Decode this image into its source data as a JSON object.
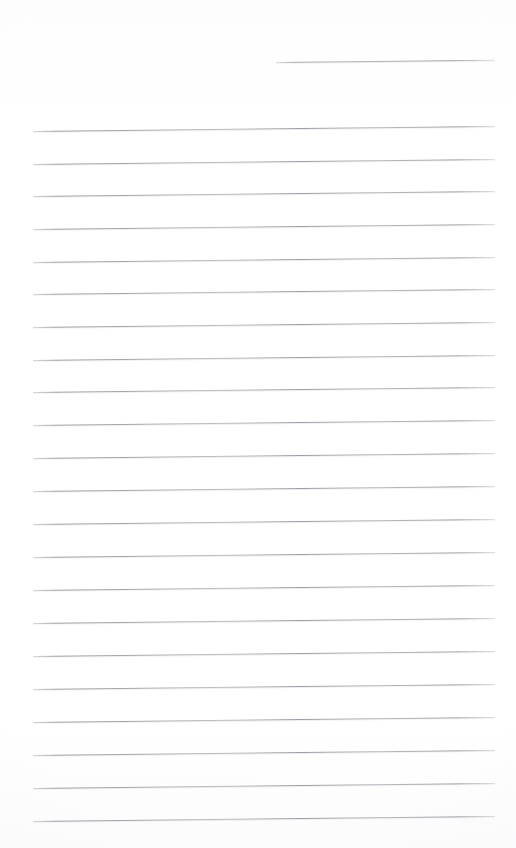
{
  "document": {
    "kind": "scanned-lined-paper",
    "title": "Blank Lined Notebook Page",
    "page_background_color": "#ffffff",
    "rule_color": "#9a9aa2",
    "page_width": 516,
    "page_height": 848,
    "content_text": "",
    "is_blank": "true",
    "rule_count": "23",
    "rule_thickness": "1",
    "margin_left": 33,
    "margin_right": 495,
    "line_spacing": 32.6,
    "skew_degrees": -0.62,
    "rules": [
      {
        "id": "rule-date-line",
        "label": "date-line",
        "x": 276,
        "y": 62,
        "width": 219,
        "text": ""
      },
      {
        "id": "rule-1",
        "label": "ruled-line-1",
        "x": 33,
        "y": 131,
        "width": 462,
        "text": ""
      },
      {
        "id": "rule-2",
        "label": "ruled-line-2",
        "x": 33,
        "y": 164,
        "width": 462,
        "text": ""
      },
      {
        "id": "rule-3",
        "label": "ruled-line-3",
        "x": 33,
        "y": 196,
        "width": 462,
        "text": ""
      },
      {
        "id": "rule-4",
        "label": "ruled-line-4",
        "x": 33,
        "y": 229,
        "width": 462,
        "text": ""
      },
      {
        "id": "rule-5",
        "label": "ruled-line-5",
        "x": 33,
        "y": 262,
        "width": 462,
        "text": ""
      },
      {
        "id": "rule-6",
        "label": "ruled-line-6",
        "x": 33,
        "y": 294,
        "width": 462,
        "text": ""
      },
      {
        "id": "rule-7",
        "label": "ruled-line-7",
        "x": 33,
        "y": 327,
        "width": 462,
        "text": ""
      },
      {
        "id": "rule-8",
        "label": "ruled-line-8",
        "x": 33,
        "y": 360,
        "width": 462,
        "text": ""
      },
      {
        "id": "rule-9",
        "label": "ruled-line-9",
        "x": 33,
        "y": 392,
        "width": 462,
        "text": ""
      },
      {
        "id": "rule-10",
        "label": "ruled-line-10",
        "x": 33,
        "y": 425,
        "width": 462,
        "text": ""
      },
      {
        "id": "rule-11",
        "label": "ruled-line-11",
        "x": 33,
        "y": 458,
        "width": 462,
        "text": ""
      },
      {
        "id": "rule-12",
        "label": "ruled-line-12",
        "x": 33,
        "y": 491,
        "width": 462,
        "text": ""
      },
      {
        "id": "rule-13",
        "label": "ruled-line-13",
        "x": 33,
        "y": 524,
        "width": 462,
        "text": ""
      },
      {
        "id": "rule-14",
        "label": "ruled-line-14",
        "x": 33,
        "y": 557,
        "width": 462,
        "text": ""
      },
      {
        "id": "rule-15",
        "label": "ruled-line-15",
        "x": 33,
        "y": 590,
        "width": 462,
        "text": ""
      },
      {
        "id": "rule-16",
        "label": "ruled-line-16",
        "x": 33,
        "y": 623,
        "width": 462,
        "text": ""
      },
      {
        "id": "rule-17",
        "label": "ruled-line-17",
        "x": 33,
        "y": 656,
        "width": 462,
        "text": ""
      },
      {
        "id": "rule-18",
        "label": "ruled-line-18",
        "x": 33,
        "y": 689,
        "width": 462,
        "text": ""
      },
      {
        "id": "rule-19",
        "label": "ruled-line-19",
        "x": 33,
        "y": 722,
        "width": 462,
        "text": ""
      },
      {
        "id": "rule-20",
        "label": "ruled-line-20",
        "x": 33,
        "y": 755,
        "width": 462,
        "text": ""
      },
      {
        "id": "rule-21",
        "label": "ruled-line-21",
        "x": 33,
        "y": 788,
        "width": 462,
        "text": ""
      },
      {
        "id": "rule-22",
        "label": "ruled-line-22",
        "x": 33,
        "y": 821,
        "width": 462,
        "text": ""
      }
    ]
  }
}
